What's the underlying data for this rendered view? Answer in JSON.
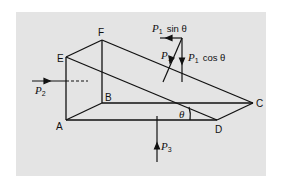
{
  "figure": {
    "background": "#e4e4e4",
    "line_color": "#111111",
    "vertices": {
      "A": "A",
      "B": "B",
      "C": "C",
      "D": "D",
      "E": "E",
      "F": "F"
    },
    "angle_label": "θ",
    "forces": {
      "p1": {
        "symbol": "P",
        "sub": "1"
      },
      "p1_sin": {
        "symbol": "P",
        "sub": "1",
        "text": "sin θ"
      },
      "p1_cos": {
        "symbol": "P",
        "sub": "1",
        "text": "cos θ"
      },
      "p2": {
        "symbol": "P",
        "sub": "2"
      },
      "p3": {
        "symbol": "P",
        "sub": "3"
      }
    }
  }
}
